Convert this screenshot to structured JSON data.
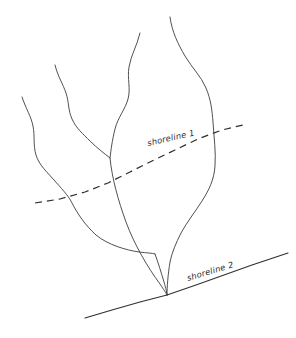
{
  "figure": {
    "background_color": "#ffffff",
    "ink_color": "#3c3c42",
    "width": 296,
    "height": 338
  },
  "labels": {
    "shoreline_1": "shoreline 1",
    "shoreline_2": "shoreline 2"
  },
  "shorelines": [
    {
      "name": "shoreline 1",
      "style": "dashed",
      "label": "shoreline 1",
      "label_x": 148,
      "label_y": 146,
      "label_rotation": -13,
      "path": "M 35 203 L 60 199 L 85 192 L 108 183 L 130 172 L 152 161 L 175 150 L 198 139 L 222 130 L 247 124",
      "color": "#2e2e34",
      "dash_pattern": "7 5"
    },
    {
      "name": "shoreline 2",
      "style": "solid",
      "label": "shoreline 2",
      "label_x": 188,
      "label_y": 281,
      "label_rotation": -17,
      "path": "M 85 318 L 112 310 L 140 302 L 167 295 L 196 285 L 224 275 L 252 265 L 288 253",
      "color": "#2e2e34",
      "dash_pattern": "none"
    }
  ],
  "streams": [
    {
      "name": "main-trunk",
      "description": "central channel from headwaters to confluence at shoreline 2",
      "path": "M 140 33 C 137 46 131 55 129 67 C 127 79 131 88 128 99 C 125 110 118 117 115 129 C 112 141 111 150 110 158 C 112 178 118 200 126 222 C 134 244 148 268 160 284 C 164 290 166 293 167 295"
    },
    {
      "name": "right-tributary",
      "description": "long right-hand branch curving down to the confluence",
      "path": "M 170 17 C 172 32 178 44 185 56 C 192 68 201 76 206 88 C 211 100 212 110 213 122 C 214 138 216 152 215 166 C 214 180 209 190 202 201 C 195 212 187 222 181 233 C 176 243 172 252 170 262 C 168 274 167 287 167 295"
    },
    {
      "name": "second-tributary",
      "description": "branch entering the trunk from the upper left",
      "path": "M 55 65 C 58 77 63 84 66 93 C 69 102 68 110 72 119 C 76 128 83 134 90 141 C 97 148 105 154 110 158"
    },
    {
      "name": "left-tributary",
      "description": "westernmost branch crossing shoreline 1 and joining the trunk",
      "path": "M 22 97 C 26 109 31 116 33 126 C 35 136 33 145 36 155 C 39 165 47 172 54 180 C 61 188 68 195 72 203 C 77 213 85 225 96 235 C 108 245 126 250 139 252 C 147 253 152 253 155 254"
    },
    {
      "name": "lower-left-distributary",
      "description": "short lower branch joining the trunk near the confluence",
      "path": "M 155 254 C 158 262 161 272 164 282 C 166 289 167 293 167 295"
    }
  ]
}
